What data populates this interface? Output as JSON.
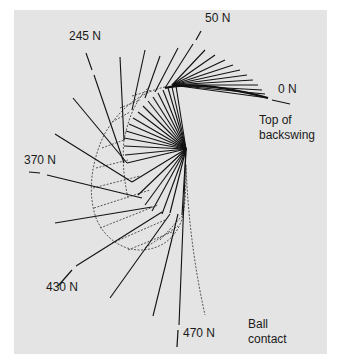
{
  "figure": {
    "background_color": "#e4e4e4",
    "line_color": "#111111",
    "dashed_color": "#555555"
  },
  "labels": {
    "force_0": "0 N",
    "force_50": "50 N",
    "force_245": "245 N",
    "force_370": "370 N",
    "force_430": "430 N",
    "force_470": "470 N",
    "top_of_backswing_line1": "Top of",
    "top_of_backswing_line2": "backswing",
    "ball_contact_line1": "Ball",
    "ball_contact_line2": "contact"
  },
  "force_annotations": [
    {
      "label": "0 N",
      "position": "right, near top of backswing"
    },
    {
      "label": "50 N",
      "position": "top"
    },
    {
      "label": "245 N",
      "position": "upper-left"
    },
    {
      "label": "370 N",
      "position": "left"
    },
    {
      "label": "430 N",
      "position": "lower-left"
    },
    {
      "label": "470 N",
      "position": "bottom, near ball contact"
    }
  ]
}
